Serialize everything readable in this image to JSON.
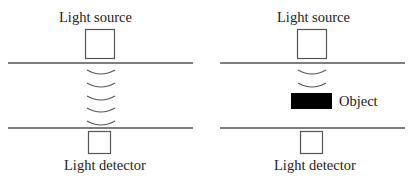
{
  "panels": [
    {
      "id": "without-object",
      "source_label": "Light source",
      "detector_label": "Light detector",
      "wave_count": 5
    },
    {
      "id": "with-object",
      "source_label": "Light source",
      "detector_label": "Light detector",
      "object_label": "Object",
      "wave_count": 2
    }
  ],
  "colors": {
    "line": "#555555",
    "object_fill": "#000000",
    "text": "#222222"
  }
}
